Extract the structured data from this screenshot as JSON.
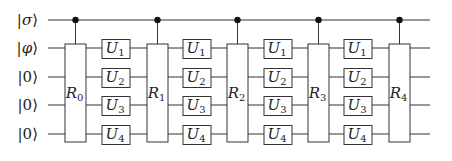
{
  "diagram": {
    "type": "quantum-circuit",
    "wires": [
      {
        "label": "|σ⟩",
        "ket": "σ",
        "y": 20
      },
      {
        "label": "|φ⟩",
        "ket": "φ",
        "y": 48
      },
      {
        "label": "|0⟩",
        "ket": "0",
        "y": 77
      },
      {
        "label": "|0⟩",
        "ket": "0",
        "y": 105
      },
      {
        "label": "|0⟩",
        "ket": "0",
        "y": 134
      }
    ],
    "r_gates": [
      {
        "label": "R",
        "sub": "0",
        "x": 65
      },
      {
        "label": "R",
        "sub": "1",
        "x": 147
      },
      {
        "label": "R",
        "sub": "2",
        "x": 227
      },
      {
        "label": "R",
        "sub": "3",
        "x": 308
      },
      {
        "label": "R",
        "sub": "4",
        "x": 389
      }
    ],
    "u_columns": [
      {
        "x": 102
      },
      {
        "x": 183
      },
      {
        "x": 264
      },
      {
        "x": 344
      }
    ],
    "u_gates": [
      {
        "label": "U",
        "sub": "1"
      },
      {
        "label": "U",
        "sub": "2"
      },
      {
        "label": "U",
        "sub": "3"
      },
      {
        "label": "U",
        "sub": "4"
      }
    ],
    "control_wire": "σ",
    "colors": {
      "line": "#333333",
      "dot": "#111111",
      "box_fill": "#ffffff"
    }
  }
}
